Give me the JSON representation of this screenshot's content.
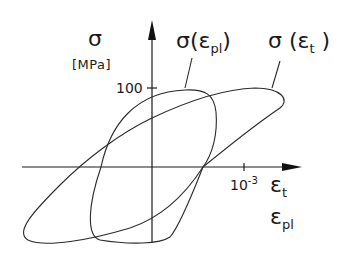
{
  "diagram": {
    "type": "hysteresis-loops",
    "y_axis": {
      "symbol": "σ",
      "unit": "[MPa]",
      "tick_label": "100"
    },
    "x_axis": {
      "tick_base": "10",
      "tick_exponent": "-3",
      "label_total": {
        "base": "ε",
        "sub": "t"
      },
      "label_plastic": {
        "base": "ε",
        "sub": "pl"
      }
    },
    "curves": [
      {
        "id": "plastic",
        "label": {
          "pre": "σ(",
          "base": "ε",
          "sub": "pl",
          "post": ")"
        }
      },
      {
        "id": "total",
        "label": {
          "pre": "σ (",
          "base": "ε",
          "sub": "t",
          "post": " )"
        }
      }
    ],
    "colors": {
      "line": "#2a2a2a",
      "background": "#ffffff"
    }
  }
}
